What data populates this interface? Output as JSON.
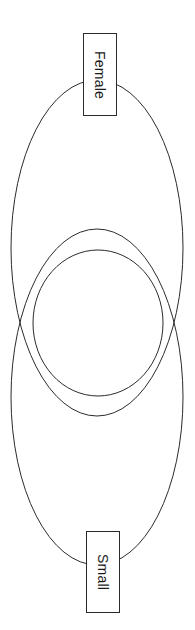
{
  "diagram": {
    "type": "venn",
    "title": "",
    "background_color": "#ffffff",
    "stroke_color": "#2b2b2b",
    "label_box_fill": "#ffffff",
    "label_box_border": "#2b2b2b",
    "text_color": "#1a1a1a",
    "text_rotation_deg": 90,
    "canvas": {
      "width": 195,
      "height": 630
    },
    "sets": [
      {
        "id": "female",
        "label": "Female",
        "shape": "ellipse",
        "cx": 97,
        "cy": 248,
        "rx": 86,
        "ry": 168,
        "label_box": {
          "x": 83,
          "y": 33,
          "width": 34,
          "height": 83
        }
      },
      {
        "id": "middle",
        "label": "",
        "shape": "ellipse",
        "cx": 98,
        "cy": 323,
        "rx": 65,
        "ry": 73,
        "label_box": null
      },
      {
        "id": "small",
        "label": "Small",
        "shape": "ellipse",
        "cx": 97,
        "cy": 397,
        "rx": 86,
        "ry": 168,
        "label_box": {
          "x": 86,
          "y": 531,
          "width": 34,
          "height": 82
        }
      }
    ],
    "intersections": [
      {
        "x": 33,
        "y": 313
      },
      {
        "x": 163,
        "y": 313
      }
    ]
  }
}
